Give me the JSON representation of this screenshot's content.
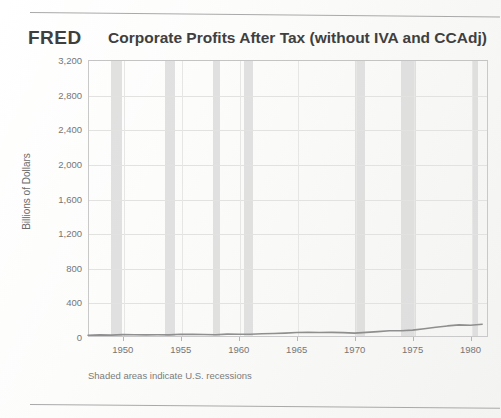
{
  "branding": {
    "logo": "FRED"
  },
  "header": {
    "title": "Corporate Profits After Tax (without IVA and CCAdj)"
  },
  "footnote": {
    "text": "Shaded areas indicate U.S. recessions"
  },
  "colors": {
    "line": "#8f8f8f",
    "recession_band": "#d6d6d6",
    "grid": "#e2e2e0",
    "axis": "#c9c9c9",
    "text": "#767676",
    "title": "#3f3f3f"
  },
  "chart_data": {
    "type": "line",
    "title": "Corporate Profits After Tax (without IVA and CCAdj)",
    "xlabel": "",
    "ylabel": "Billions of Dollars",
    "ylim": [
      0,
      3200
    ],
    "xlim": [
      1947,
      1981.5
    ],
    "ytick_labels": [
      "3,200",
      "2,800",
      "2,400",
      "2,000",
      "1,600",
      "1,200",
      "800",
      "400",
      "0"
    ],
    "ytick_values": [
      3200,
      2800,
      2400,
      2000,
      1600,
      1200,
      800,
      400,
      0
    ],
    "xtick_labels": [
      "1950",
      "1955",
      "1960",
      "1965",
      "1970",
      "1975",
      "1980"
    ],
    "xtick_values": [
      1950,
      1955,
      1960,
      1965,
      1970,
      1975,
      1980
    ],
    "grid": true,
    "legend": null,
    "series": [
      {
        "name": "Corporate Profits After Tax (without IVA and CCAdj)",
        "color": "#8f8f8f",
        "x": [
          1947.0,
          1948.0,
          1949.0,
          1950.0,
          1951.0,
          1952.0,
          1953.0,
          1954.0,
          1955.0,
          1956.0,
          1957.0,
          1958.0,
          1959.0,
          1960.0,
          1961.0,
          1962.0,
          1963.0,
          1964.0,
          1965.0,
          1966.0,
          1967.0,
          1968.0,
          1969.0,
          1970.0,
          1971.0,
          1972.0,
          1973.0,
          1974.0,
          1975.0,
          1976.0,
          1977.0,
          1978.0,
          1979.0,
          1980.0,
          1981.0
        ],
        "y": [
          21,
          25,
          22,
          28,
          26,
          25,
          26,
          25,
          31,
          30,
          29,
          26,
          33,
          31,
          32,
          37,
          40,
          45,
          52,
          55,
          52,
          54,
          51,
          45,
          53,
          62,
          72,
          73,
          79,
          96,
          112,
          128,
          140,
          135,
          148
        ]
      }
    ],
    "recession_bands": [
      {
        "start": 1948.92,
        "end": 1949.83
      },
      {
        "start": 1953.58,
        "end": 1954.42
      },
      {
        "start": 1957.67,
        "end": 1958.33
      },
      {
        "start": 1960.33,
        "end": 1961.17
      },
      {
        "start": 1969.92,
        "end": 1970.83
      },
      {
        "start": 1973.92,
        "end": 1975.17
      },
      {
        "start": 1980.08,
        "end": 1980.58
      }
    ]
  }
}
